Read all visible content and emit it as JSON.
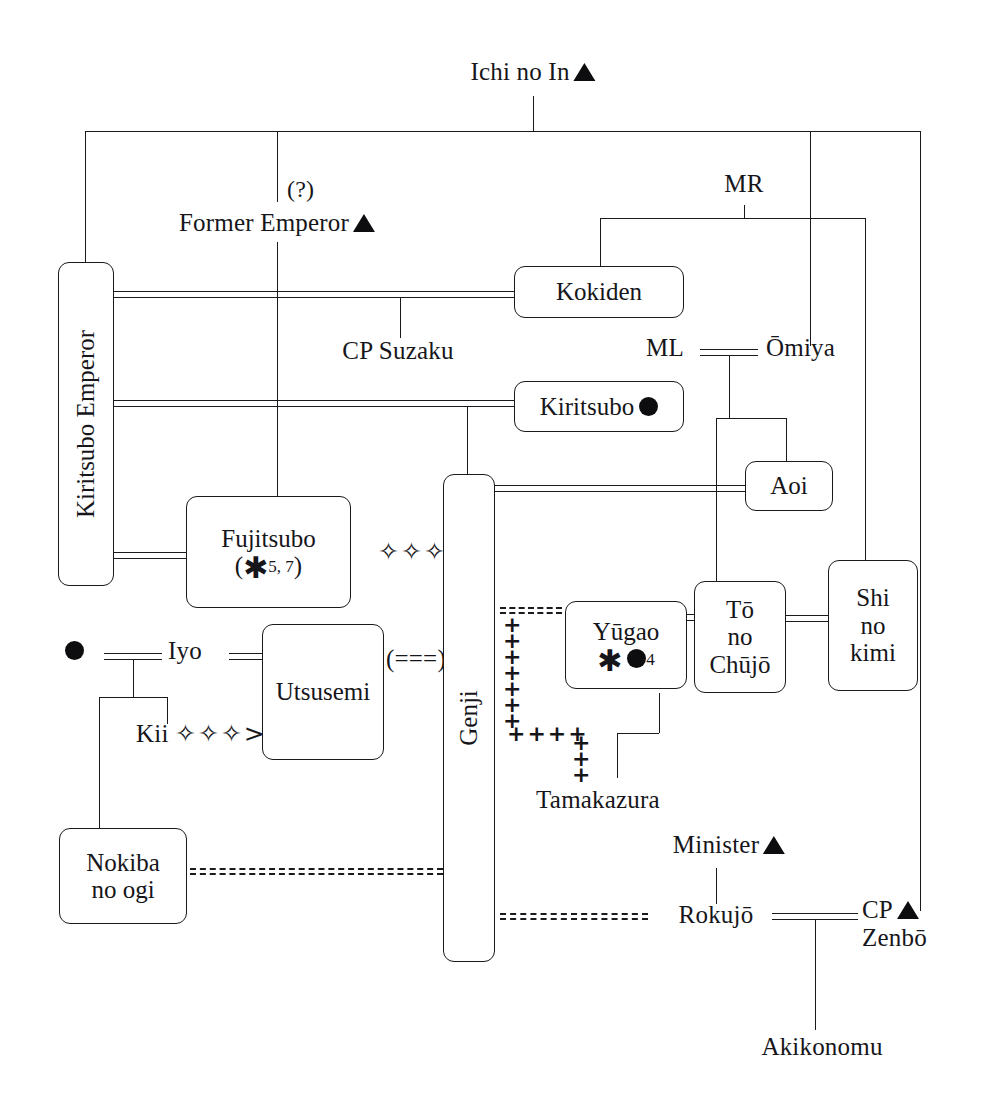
{
  "nodes": {
    "ichi_no_in": "Ichi no In",
    "former_emperor": "Former Emperor",
    "question": "(?)",
    "mr": "MR",
    "ml": "ML",
    "omiya": "Ōmiya",
    "kokiden": "Kokiden",
    "cp_suzaku": "CP Suzaku",
    "kiritsubo_emperor": "Kiritsubo Emperor",
    "kiritsubo": "Kiritsubo",
    "fujitsubo_l1": "Fujitsubo",
    "fujitsubo_l2_open": "(",
    "fujitsubo_l2_mark": "✱",
    "fujitsubo_l2_num": "5, 7",
    "fujitsubo_l2_close": ")",
    "fujitsubo_diamonds": "✧✧✧",
    "aoi": "Aoi",
    "to_no_chujo_l1": "Tō",
    "to_no_chujo_l2": "no",
    "to_no_chujo_l3": "Chūjō",
    "shi_no_kimi_l1": "Shi",
    "shi_no_kimi_l2": "no",
    "shi_no_kimi_l3": "kimi",
    "genji": "Genji",
    "yugao": "Yūgao",
    "yugao_num": "4",
    "iyo": "Iyo",
    "utsusemi": "Utsusemi",
    "utsusemi_note": "(===)",
    "kii": "Kii",
    "kii_diamonds": "✧✧✧>",
    "nokiba_l1": "Nokiba",
    "nokiba_l2": "no ogi",
    "tamakazura": "Tamakazura",
    "minister": "Minister",
    "rokujo": "Rokujō",
    "cp_zenbo_l1": "CP",
    "cp_zenbo_l2": "Zenbō",
    "akikonomu": "Akikonomu"
  },
  "marks": {
    "triangle": "▲",
    "circle": "●",
    "asterisk": "✱",
    "diamond": "✧"
  },
  "edges": {
    "affair_vertical": "+",
    "affair_horizontal": "++++",
    "dashed_double": "=============="
  },
  "colors": {
    "ink": "#16161a",
    "paper": "#ffffff"
  }
}
